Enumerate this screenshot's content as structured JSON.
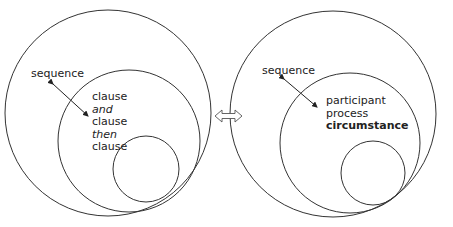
{
  "left_diagram": {
    "sequence_label": "sequence",
    "inner_lines": [
      {
        "text": "clause",
        "style": "normal"
      },
      {
        "text": "and",
        "style": "italic"
      },
      {
        "text": "clause",
        "style": "normal"
      },
      {
        "text": "then",
        "style": "italic"
      },
      {
        "text": "clause",
        "style": "normal"
      }
    ]
  },
  "connector": {
    "icon": "double-arrow-icon"
  },
  "right_diagram": {
    "sequence_label": "sequence",
    "inner_lines": [
      {
        "text": "participant",
        "style": "normal"
      },
      {
        "text": "process",
        "style": "normal"
      },
      {
        "text": "circumstance",
        "style": "bold"
      }
    ]
  },
  "colors": {
    "stroke": "#333333",
    "text": "#222222",
    "background": "#ffffff"
  }
}
